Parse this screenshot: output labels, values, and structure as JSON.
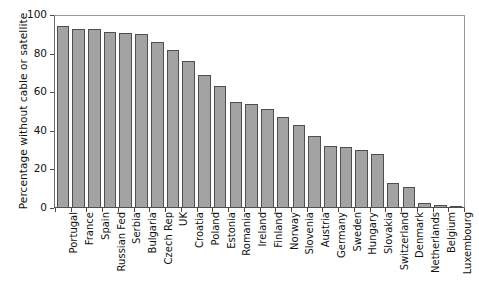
{
  "chart_data": {
    "type": "bar",
    "title": "",
    "xlabel": "",
    "ylabel": "Percentage without cable or satellite",
    "ylim": [
      0,
      100
    ],
    "yticks": [
      0,
      20,
      40,
      60,
      80,
      100
    ],
    "ytick_labels": [
      "0",
      "20",
      "40",
      "60",
      "80",
      "100"
    ],
    "grid": false,
    "legend": null,
    "bar_color": "#a3a3a3",
    "bar_edge_color": "#4f4f4f",
    "categories": [
      "Portugal",
      "France",
      "Spain",
      "Russian Fed",
      "Serbia",
      "Bulgaria",
      "Czech Rep",
      "UK",
      "Croatia",
      "Poland",
      "Estonia",
      "Romania",
      "Ireland",
      "Finland",
      "Norway",
      "Slovenia",
      "Austria",
      "Germany",
      "Sweden",
      "Hungary",
      "Slovakia",
      "Switzerland",
      "Denmark",
      "Netherlands",
      "Belgium",
      "Luxembourg"
    ],
    "values": [
      94.5,
      93,
      93,
      91,
      90.5,
      90,
      86,
      82,
      76,
      69,
      63,
      55,
      54,
      51.5,
      47,
      43,
      37.5,
      32,
      31.5,
      30,
      28,
      13,
      11,
      2.5,
      1.5,
      0.5
    ]
  }
}
